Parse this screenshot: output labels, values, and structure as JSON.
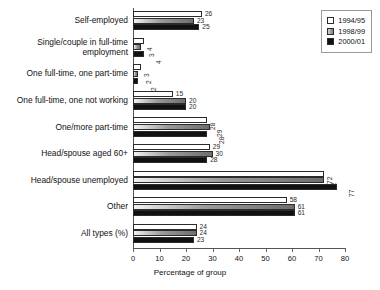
{
  "chart_data": {
    "type": "bar",
    "orientation": "horizontal",
    "title": "",
    "xlabel": "Percentage of group",
    "ylabel": "",
    "xlim": [
      0,
      80
    ],
    "xticks": [
      0,
      10,
      20,
      30,
      40,
      50,
      60,
      70,
      80
    ],
    "grid": false,
    "legend_position": "top-right",
    "categories": [
      "Self-employed",
      "Single/couple in full-time employment",
      "One full-time, one part-time",
      "One full-time, one not working",
      "One/more part-time",
      "Head/spouse aged 60+",
      "Head/spouse unemployed",
      "Other",
      "All types (%)"
    ],
    "series": [
      {
        "name": "1994/95",
        "color": "#ffffff",
        "values": [
          26,
          4,
          3,
          15,
          28,
          29,
          72,
          58,
          24
        ]
      },
      {
        "name": "1998/99",
        "color": "#8a8a8a",
        "values": [
          23,
          3,
          2,
          20,
          29,
          30,
          72,
          61,
          24
        ]
      },
      {
        "name": "2000/01",
        "color": "#111111",
        "values": [
          25,
          4,
          2,
          20,
          28,
          28,
          77,
          61,
          23
        ]
      }
    ],
    "value_labels": [
      {
        "category": "Self-employed",
        "labels": [
          "26",
          "23",
          "25"
        ],
        "rotated": false
      },
      {
        "category": "Single/couple in full-time employment",
        "labels": [
          "4",
          "3",
          "4"
        ],
        "rotated": true
      },
      {
        "category": "One full-time, one part-time",
        "labels": [
          "3",
          "2",
          "2"
        ],
        "rotated": true
      },
      {
        "category": "One full-time, one not working",
        "labels": [
          "15",
          "20",
          "20"
        ],
        "rotated": false
      },
      {
        "category": "One/more part-time",
        "labels": [
          "28",
          "29",
          "28"
        ],
        "rotated": true
      },
      {
        "category": "Head/spouse aged 60+",
        "labels": [
          "29",
          "30",
          "28"
        ],
        "rotated": false
      },
      {
        "category": "Head/spouse unemployed",
        "labels": [
          "72",
          "72",
          "77"
        ],
        "rotated": true
      },
      {
        "category": "Other",
        "labels": [
          "58",
          "61",
          "61"
        ],
        "rotated": false
      },
      {
        "category": "All types (%)",
        "labels": [
          "24",
          "24",
          "23"
        ],
        "rotated": false
      }
    ]
  },
  "legend": {
    "items": [
      {
        "label": "1994/95"
      },
      {
        "label": "1998/99"
      },
      {
        "label": "2000/01"
      }
    ]
  },
  "axis": {
    "x_title": "Percentage of group",
    "tick_labels": [
      "0",
      "10",
      "20",
      "30",
      "40",
      "50",
      "60",
      "70",
      "80"
    ]
  }
}
